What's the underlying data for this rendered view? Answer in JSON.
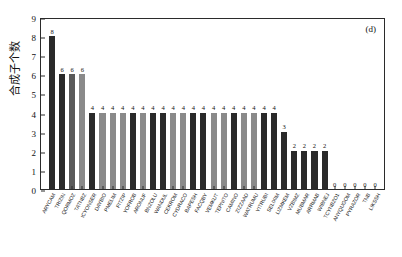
{
  "chart_data": {
    "type": "bar",
    "title": "",
    "panel_label": "(d)",
    "xlabel": "",
    "ylabel": "合成子个数",
    "ylim": [
      0,
      9
    ],
    "yticks": [
      0,
      1,
      2,
      3,
      4,
      5,
      6,
      7,
      8,
      9
    ],
    "grid": false,
    "legend": null,
    "categories": [
      "ARYCAM",
      "TRIZIN",
      "QORMOZ",
      "TATNBZ",
      "ICYONSER",
      "DAYBIO",
      "PMELIM",
      "FITZIP",
      "YOFROB",
      "ARONUF",
      "BNZOLU",
      "WANDUL",
      "CEKROM",
      "CYDRACO",
      "BAPESH",
      "FACQBY",
      "VEMKUT",
      "TEPNITO",
      "CAMINO",
      "ZIZZAAD",
      "WATRUMU",
      "YITRUBI",
      "SELIXIM",
      "LIZMKEM",
      "VZBIMZ",
      "MUBMAR",
      "ARRMAB",
      "WIBNEJ",
      "TCYNBZO1",
      "ANYQUGOM",
      "PYRAZOR",
      "TNB",
      "LIKSSH"
    ],
    "values": [
      8,
      6,
      6,
      6,
      4,
      4,
      4,
      4,
      4,
      4,
      4,
      4,
      4,
      4,
      4,
      4,
      4,
      4,
      4,
      4,
      4,
      4,
      4,
      3,
      2,
      2,
      2,
      2,
      0,
      0,
      0,
      0,
      0
    ],
    "bar_shades": [
      "dark",
      "dark",
      "mid",
      "gray",
      "dark",
      "gray",
      "gray",
      "gray",
      "dark",
      "gray",
      "dark",
      "dark",
      "gray",
      "gray",
      "dark",
      "dark",
      "gray",
      "gray",
      "dark",
      "gray",
      "gray",
      "dark",
      "dark",
      "dark",
      "dark",
      "dark",
      "dark",
      "dark",
      "dark",
      "dark",
      "dark",
      "dark",
      "dark"
    ],
    "colors": {
      "dark": "#2a2a2a",
      "mid": "#5a5a5a",
      "gray": "#8a8a8a",
      "axis": "#2b2b2b",
      "text": "#111111"
    }
  }
}
